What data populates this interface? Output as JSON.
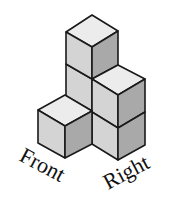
{
  "diagram": {
    "type": "isometric-cube-stack",
    "cube_count": 5,
    "labels": {
      "front": "Front",
      "right": "Right"
    },
    "colors": {
      "top_face": "#ececec",
      "left_face": "#d4d4d4",
      "right_face": "#a9a9a9",
      "edge": "#1a1a1a"
    }
  }
}
